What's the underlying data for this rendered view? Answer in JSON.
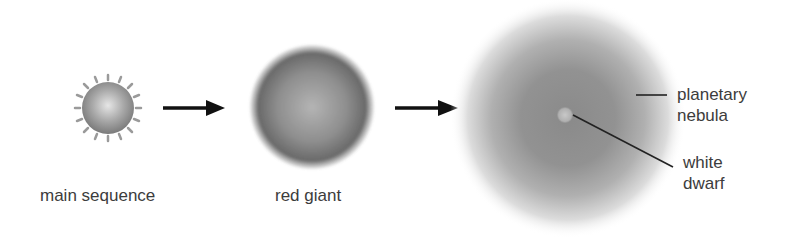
{
  "diagram": {
    "title": "",
    "stages": [
      {
        "id": "main-sequence",
        "label": "main sequence"
      },
      {
        "id": "red-giant",
        "label": "red giant"
      },
      {
        "id": "planetary-nebula-stage",
        "label": ""
      }
    ],
    "annotations": {
      "planetary_nebula": {
        "line1": "planetary",
        "line2": "nebula"
      },
      "white_dwarf": {
        "line1": "white",
        "line2": "dwarf"
      }
    },
    "arrows": [
      {
        "from": "main-sequence",
        "to": "red-giant"
      },
      {
        "from": "red-giant",
        "to": "planetary-nebula-stage"
      }
    ],
    "colors": {
      "arrow": "#111111",
      "star_gray": "#8a8a8a",
      "nebula_gray": "#8c8c8c",
      "text": "#3c3c3c"
    }
  }
}
